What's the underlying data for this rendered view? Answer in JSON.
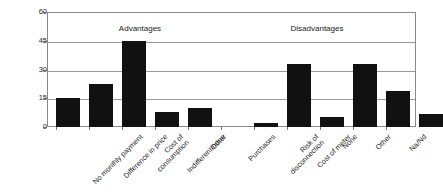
{
  "chart_data": {
    "type": "bar",
    "title": "",
    "subtitle": "",
    "xlabel": "",
    "ylabel": "",
    "ylim": [
      0,
      60
    ],
    "yticks": [
      0,
      15,
      30,
      45,
      60
    ],
    "grid": true,
    "legend": false,
    "legend_position": "none",
    "orientation": "vertical",
    "bar_color": "#111111",
    "categories": [
      "No monthly payment",
      "Difference in price",
      "Cost of consumption",
      "Indifferent/none",
      "Other",
      "Purchases",
      "Risk of disconnection",
      "Cost of meter",
      "None",
      "Other",
      "Na/Nd"
    ],
    "values": [
      15,
      22.5,
      45,
      8,
      10,
      2,
      33,
      5,
      33,
      19,
      7
    ],
    "annotations": [
      {
        "text": "Advantages",
        "group": "advantages"
      },
      {
        "text": "Disadvantages",
        "group": "disadvantages"
      }
    ],
    "groups": [
      {
        "name": "Advantages",
        "categories": [
          "No monthly payment",
          "Difference in price",
          "Cost of consumption",
          "Indifferent/none",
          "Other"
        ],
        "values": [
          15,
          22.5,
          45,
          8,
          10
        ]
      },
      {
        "name": "Disadvantages",
        "categories": [
          "Purchases",
          "Risk of disconnection",
          "Cost of meter",
          "None",
          "Other",
          "Na/Nd"
        ],
        "values": [
          2,
          33,
          5,
          33,
          19,
          7
        ]
      }
    ],
    "category_label_lines": [
      [
        "No monthly payment"
      ],
      [
        "Difference in price"
      ],
      [
        "Cost of",
        "consumption"
      ],
      [
        "Indifferent/none"
      ],
      [
        "Other"
      ],
      [
        "Purchases"
      ],
      [
        "Risk of",
        "disconnection"
      ],
      [
        "Cost of meter"
      ],
      [
        "None"
      ],
      [
        "Other"
      ],
      [
        "Na/Nd"
      ]
    ]
  },
  "colors": {
    "background": "#ffffff",
    "bar": "#111111",
    "grid": "#9a9a9a",
    "frame": "#8a8a8a",
    "text": "#1a1a1a"
  }
}
